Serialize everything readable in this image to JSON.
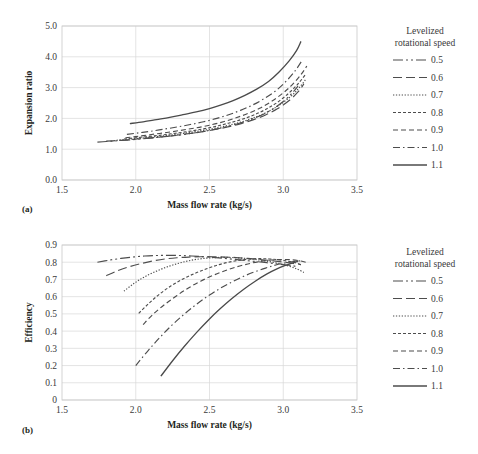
{
  "figure": {
    "panels": [
      {
        "tag": "(a)",
        "xlabel": "Mass flow rate (kg/s)",
        "ylabel": "Expansion ratio",
        "xticks": [
          "1.5",
          "2.0",
          "2.5",
          "3.0",
          "3.5"
        ],
        "yticks": [
          "0.0",
          "1.0",
          "2.0",
          "3.0",
          "4.0",
          "5.0"
        ],
        "legend_title_line1": "Levelized",
        "legend_title_line2": "rotational speed"
      },
      {
        "tag": "(b)",
        "xlabel": "Mass flow rate (kg/s)",
        "ylabel": "Efficiency",
        "xticks": [
          "1.5",
          "2.0",
          "2.5",
          "3.0",
          "3.5"
        ],
        "yticks": [
          "0",
          "0.1",
          "0.2",
          "0.3",
          "0.4",
          "0.5",
          "0.6",
          "0.7",
          "0.8",
          "0.9"
        ],
        "legend_title_line1": "Levelized",
        "legend_title_line2": "rotational speed"
      }
    ],
    "legend_entries": [
      {
        "label": "0.5",
        "dash": "10,3,2,3,2,3"
      },
      {
        "label": "0.6",
        "dash": "9,4"
      },
      {
        "label": "0.7",
        "dash": "1.3,1.6"
      },
      {
        "label": "0.8",
        "dash": "3,2"
      },
      {
        "label": "0.9",
        "dash": "5,3"
      },
      {
        "label": "1.0",
        "dash": "7,3,1.5,3"
      },
      {
        "label": "1.1",
        "dash": "none"
      }
    ],
    "colors": {
      "curve": "#4d4d4d",
      "grid": "#d9d9d9",
      "frame": "#c9c9c9",
      "text": "#231f20"
    }
  },
  "chart_data": [
    {
      "type": "line",
      "title": "",
      "panel": "(a)",
      "xlabel": "Mass flow rate (kg/s)",
      "ylabel": "Expansion ratio",
      "xlim": [
        1.5,
        3.5
      ],
      "ylim": [
        0.0,
        5.0
      ],
      "xticks": [
        1.5,
        2.0,
        2.5,
        3.0,
        3.5
      ],
      "yticks": [
        0.0,
        1.0,
        2.0,
        3.0,
        4.0,
        5.0
      ],
      "grid": true,
      "legend_title": "Levelized rotational speed",
      "legend_position": "right",
      "series": [
        {
          "name": "0.5",
          "x": [
            1.74,
            1.8,
            1.86,
            1.92,
            1.98,
            2.05,
            2.12,
            2.2,
            2.28,
            2.36,
            2.44,
            2.52,
            2.6,
            2.68,
            2.76,
            2.84,
            2.92,
            3.0,
            3.06,
            3.1
          ],
          "y": [
            1.23,
            1.25,
            1.27,
            1.29,
            1.31,
            1.34,
            1.37,
            1.41,
            1.45,
            1.5,
            1.56,
            1.63,
            1.71,
            1.81,
            1.93,
            2.08,
            2.28,
            2.55,
            2.82,
            3.05
          ]
        },
        {
          "name": "0.6",
          "x": [
            1.8,
            1.87,
            1.94,
            2.01,
            2.08,
            2.16,
            2.24,
            2.32,
            2.4,
            2.48,
            2.56,
            2.64,
            2.72,
            2.8,
            2.88,
            2.96,
            3.04,
            3.1,
            3.14
          ],
          "y": [
            1.26,
            1.28,
            1.3,
            1.33,
            1.36,
            1.39,
            1.43,
            1.48,
            1.53,
            1.59,
            1.66,
            1.74,
            1.84,
            1.96,
            2.11,
            2.31,
            2.58,
            2.86,
            3.12
          ]
        },
        {
          "name": "0.7",
          "x": [
            1.87,
            1.94,
            2.01,
            2.08,
            2.16,
            2.24,
            2.32,
            2.4,
            2.48,
            2.56,
            2.64,
            2.72,
            2.8,
            2.88,
            2.96,
            3.04,
            3.1,
            3.15
          ],
          "y": [
            1.29,
            1.32,
            1.35,
            1.38,
            1.42,
            1.46,
            1.51,
            1.57,
            1.63,
            1.7,
            1.79,
            1.89,
            2.02,
            2.18,
            2.39,
            2.67,
            2.95,
            3.25
          ]
        },
        {
          "name": "0.8",
          "x": [
            1.92,
            2.0,
            2.08,
            2.16,
            2.24,
            2.32,
            2.4,
            2.48,
            2.56,
            2.64,
            2.72,
            2.8,
            2.88,
            2.96,
            3.04,
            3.1,
            3.15
          ],
          "y": [
            1.33,
            1.37,
            1.41,
            1.45,
            1.5,
            1.55,
            1.61,
            1.68,
            1.76,
            1.86,
            1.97,
            2.11,
            2.29,
            2.52,
            2.83,
            3.12,
            3.42
          ]
        },
        {
          "name": "0.9",
          "x": [
            1.93,
            2.0,
            2.08,
            2.16,
            2.25,
            2.34,
            2.43,
            2.52,
            2.6,
            2.68,
            2.76,
            2.84,
            2.92,
            3.0,
            3.06,
            3.12,
            3.16
          ],
          "y": [
            1.37,
            1.41,
            1.46,
            1.51,
            1.57,
            1.64,
            1.71,
            1.8,
            1.9,
            2.02,
            2.16,
            2.33,
            2.55,
            2.83,
            3.09,
            3.42,
            3.7
          ]
        },
        {
          "name": "1.0",
          "x": [
            1.94,
            2.02,
            2.1,
            2.19,
            2.28,
            2.37,
            2.46,
            2.55,
            2.63,
            2.71,
            2.79,
            2.87,
            2.95,
            3.02,
            3.08,
            3.13
          ],
          "y": [
            1.48,
            1.53,
            1.58,
            1.65,
            1.72,
            1.8,
            1.89,
            2.0,
            2.12,
            2.26,
            2.43,
            2.64,
            2.9,
            3.21,
            3.54,
            3.9
          ]
        },
        {
          "name": "1.1",
          "x": [
            1.96,
            2.05,
            2.14,
            2.23,
            2.32,
            2.41,
            2.5,
            2.58,
            2.66,
            2.74,
            2.82,
            2.9,
            2.97,
            3.04,
            3.09,
            3.12
          ],
          "y": [
            1.83,
            1.89,
            1.96,
            2.03,
            2.12,
            2.21,
            2.32,
            2.44,
            2.58,
            2.75,
            2.95,
            3.2,
            3.5,
            3.87,
            4.2,
            4.5
          ]
        }
      ]
    },
    {
      "type": "line",
      "title": "",
      "panel": "(b)",
      "xlabel": "Mass flow rate (kg/s)",
      "ylabel": "Efficiency",
      "xlim": [
        1.5,
        3.5
      ],
      "ylim": [
        0.0,
        0.9
      ],
      "xticks": [
        1.5,
        2.0,
        2.5,
        3.0,
        3.5
      ],
      "yticks": [
        0.0,
        0.1,
        0.2,
        0.3,
        0.4,
        0.5,
        0.6,
        0.7,
        0.8,
        0.9
      ],
      "grid": true,
      "legend_title": "Levelized rotational speed",
      "legend_position": "right",
      "series": [
        {
          "name": "0.5",
          "x": [
            1.74,
            1.82,
            1.9,
            1.98,
            2.06,
            2.14,
            2.22,
            2.3,
            2.38,
            2.46,
            2.54,
            2.62,
            2.7,
            2.78,
            2.86,
            2.94,
            3.0,
            3.06,
            3.1
          ],
          "y": [
            0.8,
            0.812,
            0.822,
            0.83,
            0.836,
            0.839,
            0.84,
            0.839,
            0.836,
            0.832,
            0.827,
            0.821,
            0.814,
            0.807,
            0.8,
            0.792,
            0.786,
            0.78,
            0.774
          ]
        },
        {
          "name": "0.6",
          "x": [
            1.8,
            1.88,
            1.96,
            2.04,
            2.12,
            2.2,
            2.28,
            2.36,
            2.44,
            2.52,
            2.6,
            2.68,
            2.76,
            2.84,
            2.92,
            3.0,
            3.06,
            3.12
          ],
          "y": [
            0.722,
            0.752,
            0.775,
            0.793,
            0.808,
            0.819,
            0.826,
            0.83,
            0.832,
            0.832,
            0.83,
            0.827,
            0.822,
            0.816,
            0.809,
            0.801,
            0.794,
            0.786
          ]
        },
        {
          "name": "0.7",
          "x": [
            1.92,
            1.99,
            2.06,
            2.14,
            2.22,
            2.3,
            2.38,
            2.46,
            2.54,
            2.62,
            2.7,
            2.78,
            2.86,
            2.94,
            3.02,
            3.09,
            3.14
          ],
          "y": [
            0.632,
            0.678,
            0.715,
            0.748,
            0.775,
            0.796,
            0.812,
            0.822,
            0.827,
            0.828,
            0.825,
            0.819,
            0.81,
            0.798,
            0.782,
            0.762,
            0.74
          ]
        },
        {
          "name": "0.8",
          "x": [
            2.02,
            2.09,
            2.16,
            2.24,
            2.32,
            2.4,
            2.48,
            2.56,
            2.64,
            2.72,
            2.8,
            2.88,
            2.96,
            3.03,
            3.09,
            3.13
          ],
          "y": [
            0.503,
            0.562,
            0.614,
            0.663,
            0.703,
            0.735,
            0.762,
            0.785,
            0.802,
            0.814,
            0.82,
            0.82,
            0.815,
            0.806,
            0.795,
            0.782
          ]
        },
        {
          "name": "0.9",
          "x": [
            2.05,
            2.12,
            2.2,
            2.28,
            2.36,
            2.44,
            2.52,
            2.6,
            2.68,
            2.76,
            2.84,
            2.92,
            3.0,
            3.06,
            3.12,
            3.16
          ],
          "y": [
            0.438,
            0.5,
            0.557,
            0.607,
            0.652,
            0.69,
            0.722,
            0.749,
            0.772,
            0.79,
            0.804,
            0.813,
            0.816,
            0.814,
            0.807,
            0.798
          ]
        },
        {
          "name": "1.0",
          "x": [
            2.0,
            2.08,
            2.16,
            2.24,
            2.32,
            2.4,
            2.48,
            2.56,
            2.64,
            2.72,
            2.8,
            2.88,
            2.95,
            3.02,
            3.08,
            3.12
          ],
          "y": [
            0.2,
            0.283,
            0.36,
            0.43,
            0.492,
            0.548,
            0.598,
            0.642,
            0.68,
            0.714,
            0.742,
            0.766,
            0.784,
            0.797,
            0.805,
            0.808
          ]
        },
        {
          "name": "1.1",
          "x": [
            2.17,
            2.25,
            2.33,
            2.41,
            2.49,
            2.57,
            2.65,
            2.73,
            2.81,
            2.89,
            2.95,
            3.01,
            3.06,
            3.1
          ],
          "y": [
            0.138,
            0.228,
            0.312,
            0.39,
            0.462,
            0.528,
            0.588,
            0.642,
            0.69,
            0.732,
            0.758,
            0.78,
            0.795,
            0.805
          ]
        }
      ]
    }
  ]
}
